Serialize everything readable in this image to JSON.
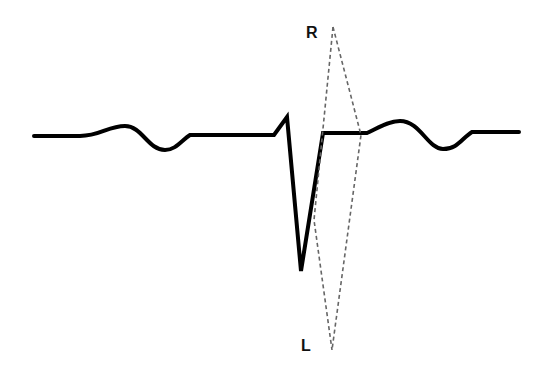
{
  "diagram": {
    "title": "",
    "labels": {
      "top": "R",
      "bottom": "L"
    },
    "colors": {
      "trace": "#000000",
      "vector": "#666666",
      "background": "#ffffff"
    },
    "elements": [
      {
        "type": "ecg-trace",
        "description": "ECG waveform with P wave, deep negative QRS complex, and T wave"
      },
      {
        "type": "dashed-vector-loop",
        "description": "Narrow dashed loop from R (top) to L (bottom)"
      }
    ]
  }
}
